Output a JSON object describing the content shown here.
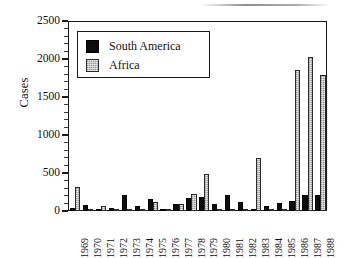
{
  "chart_data": {
    "type": "bar",
    "title": "",
    "subtitle": "",
    "xlabel": "",
    "ylabel": "Cases",
    "ylim": [
      0,
      2500
    ],
    "yticks": [
      0,
      500,
      1000,
      1500,
      2000,
      2500
    ],
    "ytick_labels": [
      "0",
      "500",
      "1000",
      "1500",
      "2000",
      "2500"
    ],
    "minor_tick_interval": 100,
    "grid": false,
    "legend_position": "upper left (inside axes)",
    "categories": [
      "1969",
      "1970",
      "1971",
      "1972",
      "1973",
      "1974",
      "1975",
      "1976",
      "1977",
      "1978",
      "1979",
      "1980",
      "1981",
      "1982",
      "1983",
      "1984",
      "1985",
      "1986",
      "1987",
      "1988"
    ],
    "series": [
      {
        "name": "South America",
        "color": "#0d0d0d",
        "fill": "solid-black",
        "values": [
          45,
          85,
          20,
          45,
          205,
          65,
          160,
          10,
          90,
          165,
          180,
          90,
          210,
          115,
          30,
          70,
          100,
          135,
          205,
          205
        ]
      },
      {
        "name": "Africa",
        "color": "#c3c3c3",
        "fill": "stippled-light-gray",
        "values": [
          320,
          10,
          65,
          5,
          5,
          15,
          120,
          30,
          95,
          230,
          485,
          10,
          5,
          10,
          700,
          10,
          15,
          1855,
          2030,
          1785
        ]
      }
    ]
  },
  "legend": {
    "entries": [
      {
        "label": "South America",
        "swatch": "black-square-swatch"
      },
      {
        "label": "Africa",
        "swatch": "gray-square-swatch"
      }
    ]
  },
  "axes": {
    "y_axis_label": "Cases"
  }
}
